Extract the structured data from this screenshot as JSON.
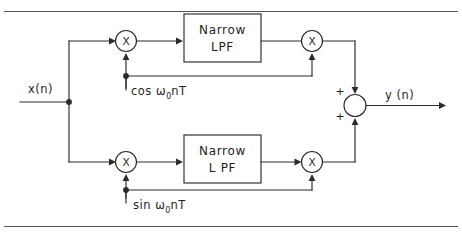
{
  "figure": {
    "name": "quadrature-narrowband-filter-block-diagram",
    "background_color": "#ffffff",
    "line_color": "#2b2b2b",
    "rule_color": "#555555"
  },
  "io": {
    "input_label": "x(n)",
    "output_label": "y (n)"
  },
  "blocks": [
    {
      "id": "lpf-upper",
      "line1": "Narrow",
      "line2": "LPF"
    },
    {
      "id": "lpf-lower",
      "line1": "Narrow",
      "line2": "L PF"
    }
  ],
  "multipliers": [
    {
      "id": "mult-upper-left",
      "symbol": "X"
    },
    {
      "id": "mult-upper-right",
      "symbol": "X"
    },
    {
      "id": "mult-lower-left",
      "symbol": "X"
    },
    {
      "id": "mult-lower-right",
      "symbol": "X"
    }
  ],
  "summer": {
    "id": "summing-junction",
    "sign_top": "+",
    "sign_bottom": "+"
  },
  "carriers": [
    {
      "id": "carrier-cosine",
      "func": "cos",
      "omega": "ω",
      "subscript": "0",
      "suffix": "nT",
      "full": "cos ω0nT"
    },
    {
      "id": "carrier-sine",
      "func": "sin",
      "omega": "ω",
      "subscript": "0",
      "suffix": "nT",
      "full": "sin ω0nT"
    }
  ]
}
